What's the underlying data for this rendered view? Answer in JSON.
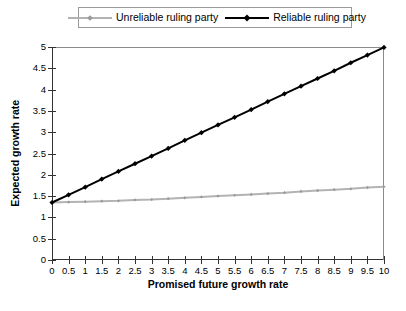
{
  "legend": {
    "position": "top-center",
    "entries": [
      {
        "label": "Unreliable ruling party",
        "color": "#b3b3b3",
        "marker": "diamond-marker"
      },
      {
        "label": "Reliable ruling party",
        "color": "#000000",
        "marker": "diamond-marker"
      }
    ]
  },
  "axes": {
    "x_title": "Promised future growth rate",
    "y_title": "Expected growth rate"
  },
  "caption": "",
  "chart_data": {
    "type": "line",
    "title": "",
    "xlabel": "Promised future growth rate",
    "ylabel": "Expected growth rate",
    "xlim": [
      0,
      10
    ],
    "ylim": [
      0,
      5
    ],
    "xticks": [
      "0",
      "0.5",
      "1",
      "1.5",
      "2",
      "2.5",
      "3",
      "3.5",
      "4",
      "4.5",
      "5",
      "5.5",
      "6",
      "6.5",
      "7",
      "7.5",
      "8",
      "8.5",
      "9",
      "9.5",
      "10"
    ],
    "yticks": [
      "0",
      "0.5",
      "1",
      "1.5",
      "2",
      "2.5",
      "3",
      "3.5",
      "4",
      "4.5",
      "5"
    ],
    "grid": false,
    "legend_position": "top-center",
    "x": [
      0,
      0.5,
      1,
      1.5,
      2,
      2.5,
      3,
      3.5,
      4,
      4.5,
      5,
      5.5,
      6,
      6.5,
      7,
      7.5,
      8,
      8.5,
      9,
      9.5,
      10
    ],
    "series": [
      {
        "name": "Unreliable ruling party",
        "color": "#b3b3b3",
        "values": [
          1.35,
          1.36,
          1.37,
          1.38,
          1.39,
          1.41,
          1.42,
          1.44,
          1.46,
          1.48,
          1.5,
          1.52,
          1.54,
          1.56,
          1.58,
          1.61,
          1.63,
          1.65,
          1.67,
          1.7,
          1.72
        ]
      },
      {
        "name": "Reliable ruling party",
        "color": "#000000",
        "values": [
          1.35,
          1.53,
          1.71,
          1.9,
          2.08,
          2.26,
          2.44,
          2.62,
          2.81,
          2.99,
          3.17,
          3.35,
          3.53,
          3.72,
          3.9,
          4.08,
          4.26,
          4.44,
          4.63,
          4.81,
          4.99
        ]
      }
    ]
  }
}
